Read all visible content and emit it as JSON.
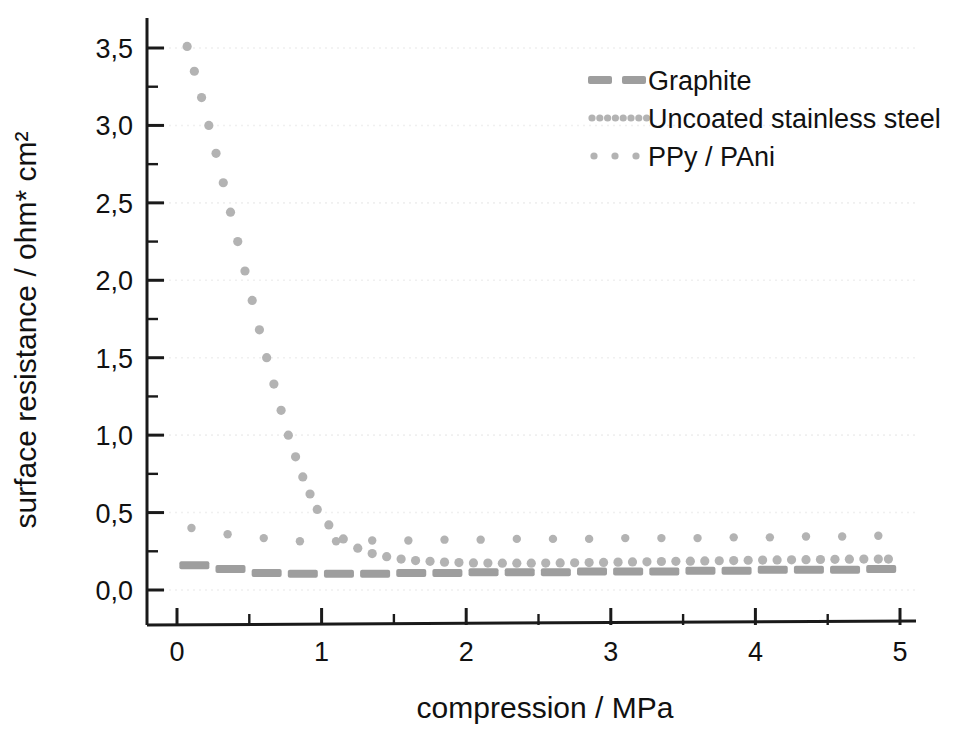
{
  "chart_data": {
    "type": "scatter",
    "title": "",
    "xlabel": "compression / MPa",
    "ylabel": "surface resistance / ohm* cm²",
    "xlim": [
      -0.12,
      5.35
    ],
    "ylim": [
      -0.22,
      3.72
    ],
    "xticks": [
      0,
      1,
      2,
      3,
      4,
      5
    ],
    "xticklabels": [
      "0",
      "1",
      "2",
      "3",
      "4",
      "5"
    ],
    "xminor_step": 0.5,
    "yticks": [
      0.0,
      0.5,
      1.0,
      1.5,
      2.0,
      2.5,
      3.0,
      3.5
    ],
    "yticklabels": [
      "0,0",
      "0,5",
      "1,0",
      "1,5",
      "2,0",
      "2,5",
      "3,0",
      "3,5"
    ],
    "yminor_step": 0.25,
    "grid": "horizontal-dotted-faint",
    "legend_position": "top-right",
    "decimal_separator": ",",
    "series_color": "#b3b3b3",
    "axis_color": "#1a1a1a",
    "grid_color": "#f0f0f0",
    "series": [
      {
        "name": "Graphite",
        "marker": "dash",
        "color": "#9e9e9e",
        "x": [
          0.12,
          0.37,
          0.62,
          0.87,
          1.12,
          1.37,
          1.62,
          1.87,
          2.12,
          2.37,
          2.62,
          2.87,
          3.12,
          3.37,
          3.62,
          3.87,
          4.12,
          4.37,
          4.62,
          4.87
        ],
        "y": [
          0.16,
          0.135,
          0.11,
          0.105,
          0.105,
          0.105,
          0.11,
          0.11,
          0.115,
          0.115,
          0.115,
          0.12,
          0.12,
          0.12,
          0.125,
          0.125,
          0.13,
          0.13,
          0.13,
          0.135
        ]
      },
      {
        "name": "Uncoated stainless steel",
        "marker": "dot-dense",
        "color": "#b3b3b3",
        "x": [
          0.07,
          0.12,
          0.17,
          0.22,
          0.27,
          0.32,
          0.37,
          0.42,
          0.47,
          0.52,
          0.57,
          0.62,
          0.67,
          0.72,
          0.77,
          0.82,
          0.87,
          0.92,
          0.97,
          1.05,
          1.15,
          1.25,
          1.35,
          1.45,
          1.55,
          1.65,
          1.75,
          1.85,
          1.95,
          2.05,
          2.15,
          2.25,
          2.35,
          2.45,
          2.55,
          2.65,
          2.75,
          2.85,
          2.95,
          3.05,
          3.15,
          3.25,
          3.35,
          3.45,
          3.55,
          3.65,
          3.75,
          3.85,
          3.95,
          4.05,
          4.15,
          4.25,
          4.35,
          4.45,
          4.55,
          4.65,
          4.75,
          4.85,
          4.92
        ],
        "y": [
          3.51,
          3.35,
          3.18,
          3.0,
          2.82,
          2.63,
          2.44,
          2.25,
          2.06,
          1.87,
          1.68,
          1.5,
          1.33,
          1.16,
          1.0,
          0.86,
          0.73,
          0.62,
          0.52,
          0.42,
          0.33,
          0.27,
          0.235,
          0.215,
          0.2,
          0.19,
          0.185,
          0.18,
          0.177,
          0.175,
          0.174,
          0.173,
          0.173,
          0.173,
          0.174,
          0.175,
          0.176,
          0.177,
          0.178,
          0.18,
          0.181,
          0.182,
          0.184,
          0.185,
          0.186,
          0.188,
          0.189,
          0.19,
          0.192,
          0.193,
          0.194,
          0.195,
          0.196,
          0.197,
          0.198,
          0.199,
          0.2,
          0.2,
          0.2
        ]
      },
      {
        "name": "PPy / PAni",
        "marker": "dot-sparse",
        "color": "#b3b3b3",
        "x": [
          0.1,
          0.35,
          0.6,
          0.85,
          1.1,
          1.35,
          1.6,
          1.85,
          2.1,
          2.35,
          2.6,
          2.85,
          3.1,
          3.35,
          3.6,
          3.85,
          4.1,
          4.35,
          4.6,
          4.85
        ],
        "y": [
          0.4,
          0.36,
          0.335,
          0.315,
          0.315,
          0.32,
          0.32,
          0.325,
          0.325,
          0.33,
          0.33,
          0.33,
          0.335,
          0.335,
          0.335,
          0.34,
          0.34,
          0.345,
          0.345,
          0.35
        ]
      }
    ]
  },
  "legend": {
    "items": [
      {
        "label": "Graphite",
        "marker": "dash"
      },
      {
        "label": "Uncoated stainless steel",
        "marker": "dot-dense"
      },
      {
        "label": "PPy / PAni",
        "marker": "dot-sparse"
      }
    ]
  },
  "axes": {
    "x_title": "compression / MPa",
    "y_title": "surface resistance / ohm* cm²"
  }
}
